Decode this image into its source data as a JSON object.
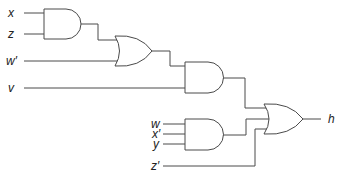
{
  "inputs": {
    "x": "x",
    "z": "z",
    "w_prime": "w′",
    "v": "v",
    "w": "w",
    "x_prime": "x′",
    "y": "y",
    "z_prime": "z′"
  },
  "output": {
    "h": "h"
  },
  "gates": [
    {
      "id": "and1",
      "type": "AND",
      "inputs": [
        "x",
        "z"
      ]
    },
    {
      "id": "or1",
      "type": "OR",
      "inputs": [
        "and1",
        "w′"
      ]
    },
    {
      "id": "and2",
      "type": "AND",
      "inputs": [
        "or1",
        "v"
      ]
    },
    {
      "id": "and3",
      "type": "AND",
      "inputs": [
        "w",
        "x′",
        "y"
      ]
    },
    {
      "id": "or2",
      "type": "OR",
      "inputs": [
        "and2",
        "and3",
        "z′"
      ],
      "output": "h"
    }
  ],
  "colors": {
    "line": "#4a4a4a",
    "text": "#222222",
    "background": "#ffffff"
  }
}
